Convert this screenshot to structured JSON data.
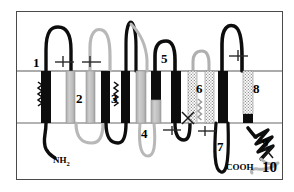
{
  "figure": {
    "kind": "membrane-topology-diagram",
    "title_visible": false,
    "background_color": "#ffffff",
    "frame_color": "#4a4a4a",
    "membrane": {
      "outer_leaflet_y": 71,
      "inner_leaflet_y": 123,
      "line_color": "#8a8a8a",
      "x_start": 17,
      "x_end": 282
    },
    "colors": {
      "black": "#0d0d0d",
      "gray_light": "#bdbdbd",
      "gray_mid": "#9e9e9e",
      "gray_dark": "#6e6e6e",
      "stipple": "#b5b5b5",
      "loop_black": "#0d0d0d",
      "loop_gray": "#b8b8b8"
    }
  },
  "helices": [
    {
      "id": 1,
      "label": "1",
      "fill": "black",
      "x": 46,
      "label_x": 36,
      "label_y": 63,
      "label_size": 13
    },
    {
      "id": 2,
      "label": "2",
      "fill": "gray",
      "x": 76,
      "label_x": 77,
      "label_y": 99,
      "label_size": 13
    },
    {
      "id": 3,
      "label": "3",
      "fill": "black",
      "x": 112,
      "label_x": 111,
      "label_y": 99,
      "label_size": 13
    },
    {
      "id": 4,
      "label": "4",
      "fill": "gray",
      "x": 145,
      "label_x": 142,
      "label_y": 140,
      "label_size": 13
    },
    {
      "id": 5,
      "label": "5",
      "fill": "half",
      "x": 160,
      "label_x": 160,
      "label_y": 68,
      "label_size": 13
    },
    {
      "id": 6,
      "label": "6",
      "fill": "stipple",
      "x": 197,
      "label_x": 196,
      "label_y": 93,
      "label_size": 13
    },
    {
      "id": 7,
      "label": "7",
      "fill": "black",
      "x": 222,
      "label_x": 216,
      "label_y": 152,
      "label_size": 13
    },
    {
      "id": 8,
      "label": "8",
      "fill": "stipple",
      "x": 248,
      "label_x": 252,
      "label_y": 92,
      "label_size": 13
    },
    {
      "id": 9,
      "label": "9",
      "fill": "zigzag",
      "x": 262,
      "label_x": 262,
      "label_y": 147,
      "label_size": 13
    },
    {
      "id": 10,
      "label": "10",
      "fill": "gray-coil",
      "x": 272,
      "label_x": 265,
      "label_y": 172,
      "label_size": 15
    }
  ],
  "termini": [
    {
      "name": "n-terminus",
      "label": "NH",
      "subscript": "2",
      "x": 53,
      "y": 163
    },
    {
      "name": "c-terminus",
      "label": "COOH",
      "subscript": "",
      "x": 216,
      "y": 170
    }
  ],
  "glycosylation_markers": [
    {
      "x": 63,
      "y": 62
    },
    {
      "x": 90,
      "y": 62
    },
    {
      "x": 172,
      "y": 126
    },
    {
      "x": 205,
      "y": 126
    },
    {
      "x": 238,
      "y": 58
    }
  ],
  "phosphorylation_markers": [
    {
      "x": 188,
      "y": 118,
      "kind": "x-cross"
    },
    {
      "x": 268,
      "y": 152,
      "kind": "x-cross"
    }
  ],
  "amphipathic_springs": [
    {
      "x": 42,
      "y": 90
    },
    {
      "x": 128,
      "y": 90
    },
    {
      "x": 193,
      "y": 100
    }
  ]
}
